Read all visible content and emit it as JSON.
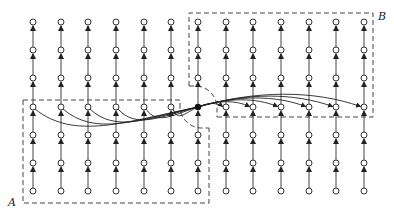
{
  "diagram": {
    "regions": [
      {
        "id": "A",
        "label": "A"
      },
      {
        "id": "B",
        "label": "B"
      }
    ],
    "grid": {
      "columns_x": [
        33,
        61,
        88,
        116,
        144,
        171,
        198,
        226,
        253,
        281,
        309,
        336,
        364
      ],
      "rows_y": [
        22,
        50,
        78,
        107,
        135,
        163,
        191
      ],
      "node_radius": 3,
      "flow_direction": "up"
    },
    "hub": {
      "x": 198,
      "y": 107
    },
    "left_sources_row": 3,
    "right_targets_row": 3,
    "colors": {
      "stroke": "#333333",
      "background": "#ffffff",
      "hub": "#111111"
    }
  }
}
